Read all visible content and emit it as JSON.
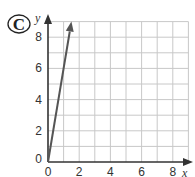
{
  "label": "C",
  "chart_data": {
    "type": "line",
    "title": "",
    "xlabel": "x",
    "ylabel": "y",
    "xlim": [
      0,
      9
    ],
    "ylim": [
      0,
      9
    ],
    "grid": true,
    "x_ticks": [
      "0",
      "2",
      "4",
      "6",
      "8"
    ],
    "y_ticks": [
      "0",
      "2",
      "4",
      "6",
      "8"
    ],
    "series": [
      {
        "name": "line",
        "x": [
          0,
          1.5
        ],
        "y": [
          0,
          9
        ],
        "equation": "y = 6x",
        "arrow_end": true
      }
    ]
  },
  "colors": {
    "grid": "#c8c8c8",
    "axis": "#333333",
    "line": "#555555"
  }
}
